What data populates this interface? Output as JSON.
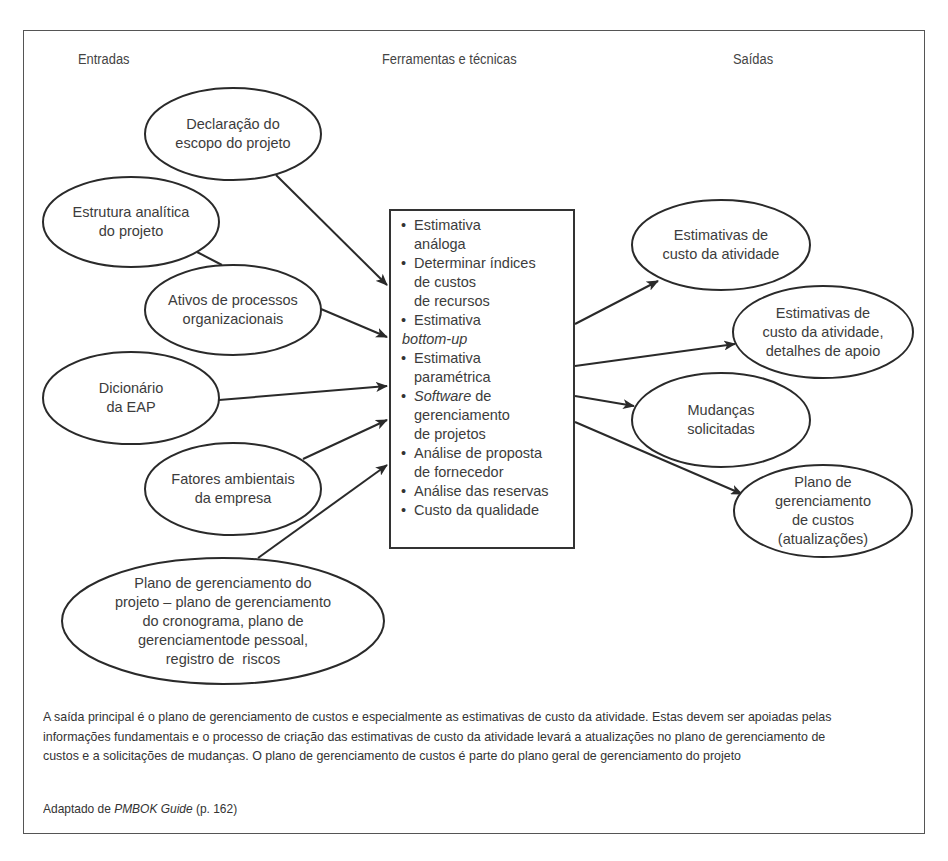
{
  "headers": {
    "inputs": "Entradas",
    "tools": "Ferramentas e técnicas",
    "outputs": "Saídas"
  },
  "inputs": [
    {
      "id": "declaracao",
      "lines": [
        "Declaração do",
        "escopo do projeto"
      ]
    },
    {
      "id": "estrutura",
      "lines": [
        "Estrutura analítica",
        "do projeto"
      ]
    },
    {
      "id": "ativos",
      "lines": [
        "Ativos de processos",
        "organizacionais"
      ]
    },
    {
      "id": "dicionario",
      "lines": [
        "Dicionário",
        "da EAP"
      ]
    },
    {
      "id": "fatores",
      "lines": [
        "Fatores ambientais",
        "da empresa"
      ]
    },
    {
      "id": "plano-projeto",
      "lines": [
        "Plano de gerenciamento do",
        "projeto – plano de gerenciamento",
        "do cronograma, plano de",
        "gerenciamentode pessoal,",
        "registro de  riscos"
      ]
    }
  ],
  "tools": [
    {
      "parts": [
        {
          "t": "Estimativa",
          "i": false
        }
      ],
      "cont": [
        "análoga"
      ]
    },
    {
      "parts": [
        {
          "t": "Determinar índices",
          "i": false
        }
      ],
      "cont": [
        "de custos",
        "de recursos"
      ]
    },
    {
      "parts": [
        {
          "t": "Estimativa",
          "i": false
        }
      ],
      "cont_italic": [
        "bottom-up"
      ]
    },
    {
      "parts": [
        {
          "t": "Estimativa",
          "i": false
        }
      ],
      "cont": [
        "paramétrica"
      ]
    },
    {
      "parts": [
        {
          "t": "Software",
          "i": true
        },
        {
          "t": " de",
          "i": false
        }
      ],
      "cont": [
        "gerenciamento",
        "de projetos"
      ]
    },
    {
      "parts": [
        {
          "t": "Análise de proposta",
          "i": false
        }
      ],
      "cont": [
        "de fornecedor"
      ]
    },
    {
      "parts": [
        {
          "t": "Análise das reservas",
          "i": false
        }
      ],
      "cont": []
    },
    {
      "parts": [
        {
          "t": "Custo da qualidade",
          "i": false
        }
      ],
      "cont": []
    }
  ],
  "outputs": [
    {
      "id": "estimativas",
      "lines": [
        "Estimativas de",
        "custo da atividade"
      ]
    },
    {
      "id": "estimativas-apoio",
      "lines": [
        "Estimativas de",
        "custo da atividade,",
        "detalhes de apoio"
      ]
    },
    {
      "id": "mudancas",
      "lines": [
        "Mudanças",
        "solicitadas"
      ]
    },
    {
      "id": "plano-custos",
      "lines": [
        "Plano de",
        "gerenciamento",
        "de custos",
        "(atualizações)"
      ]
    }
  ],
  "caption": "A saída principal é o plano de gerenciamento de custos e especialmente as estimativas de custo da atividade. Estas devem ser apoiadas pelas informações fundamentais e o processo de criação das estimativas de custo da atividade levará a atualizações no plano de gerenciamento de custos e a solicitações de mudanças. O plano de gerenciamento de custos é parte do plano geral de gerenciamento do projeto",
  "source": {
    "prefix": "Adaptado de ",
    "title": "PMBOK Guide",
    "suffix": " (p. 162)"
  },
  "colors": {
    "stroke": "#2a2a2a",
    "text": "#3c3c3c",
    "frame": "#555555"
  }
}
